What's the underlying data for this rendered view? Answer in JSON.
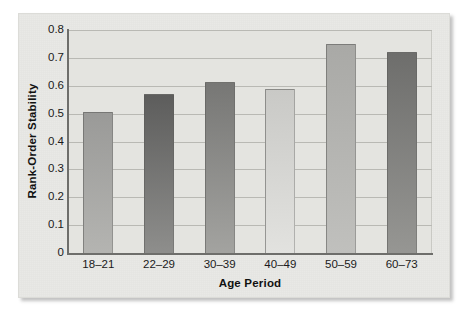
{
  "figure": {
    "background_color": "#ffffff",
    "panel_color": "#e9e9e6",
    "plot_color": "#e4e4e0",
    "gridline_color": "#b9b9b4",
    "axis_color": "#6e6e6b"
  },
  "chart_data": {
    "type": "bar",
    "title": "",
    "xlabel": "Age Period",
    "ylabel": "Rank-Order Stability",
    "categories": [
      "18–21",
      "22–29",
      "30–39",
      "40–49",
      "50–59",
      "60–73"
    ],
    "values": [
      0.505,
      0.57,
      0.615,
      0.59,
      0.75,
      0.72
    ],
    "ylim": [
      0,
      0.8
    ],
    "ytick_labels": [
      "0.8",
      "0.7",
      "0.6",
      "0.5",
      "0.4",
      "0.3",
      "0.2",
      "0.1",
      "0"
    ],
    "ytick_values": [
      0.8,
      0.7,
      0.6,
      0.5,
      0.4,
      0.3,
      0.2,
      0.1,
      0
    ],
    "grid": true,
    "grid_axis": "y",
    "legend": false,
    "legend_position": "none",
    "bar_colors": [
      "#9a9a98",
      "#5d5d5c",
      "#777775",
      "#c9c9c6",
      "#a9a9a6",
      "#6e6e6c"
    ],
    "bar_colors_bottom": [
      "#b4b4b1",
      "#8e8e8c",
      "#a3a3a0",
      "#e2e2df",
      "#c0c0bd",
      "#969693"
    ]
  }
}
